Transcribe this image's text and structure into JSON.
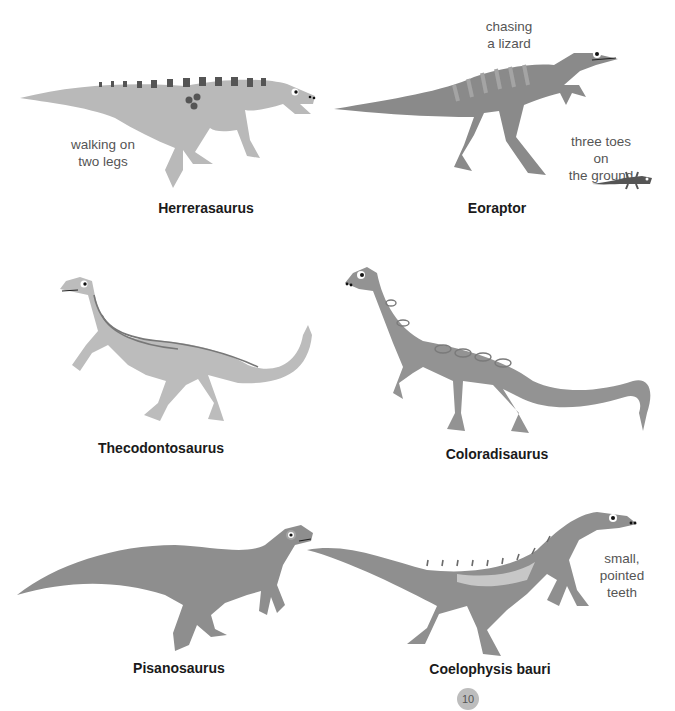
{
  "page": {
    "number": "10",
    "dinosaurs": [
      {
        "name": "Herrerasaurus",
        "note": "walking on\ntwo legs",
        "color": "#b9b9b9"
      },
      {
        "name": "Eoraptor",
        "notes": [
          "chasing\na lizard",
          "three toes on\nthe ground"
        ],
        "color": "#8a8a8a"
      },
      {
        "name": "Thecodontosaurus",
        "color": "#bcbcbc"
      },
      {
        "name": "Coloradisaurus",
        "color": "#939393"
      },
      {
        "name": "Pisanosaurus",
        "color": "#8e8e8e"
      },
      {
        "name": "Coelophysis bauri",
        "note": "small,\npointed teeth",
        "color": "#8f8f8f"
      }
    ]
  }
}
